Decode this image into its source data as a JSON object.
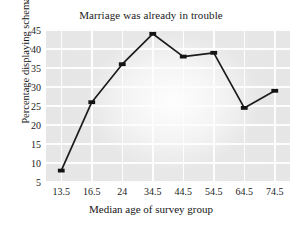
{
  "chart_data": {
    "type": "line",
    "title": "Marriage was already in trouble",
    "xlabel": "Median age of survey group",
    "ylabel": "Percentage displaying schema",
    "categories": [
      "13.5",
      "16.5",
      "24",
      "34.5",
      "44.5",
      "54.5",
      "64.5",
      "74.5"
    ],
    "values": [
      8,
      26,
      36,
      44,
      38,
      39,
      24.5,
      29
    ],
    "series": [
      {
        "name": "Percentage displaying schema",
        "values": [
          8,
          26,
          36,
          44,
          38,
          39,
          24.5,
          29
        ]
      }
    ],
    "ylim": [
      5,
      45
    ],
    "yticks": [
      5,
      10,
      15,
      20,
      25,
      30,
      35,
      40,
      45
    ],
    "ytick_labels": [
      "5",
      "10",
      "15",
      "20",
      "25",
      "30",
      "35",
      "40",
      "45"
    ],
    "xtick_labels": [
      "13.5",
      "16.5",
      "24",
      "34.5",
      "44.5",
      "54.5",
      "64.5",
      "74.5"
    ],
    "grid": true,
    "legend": "none",
    "marker": "square",
    "line_color": "#1c1c1c",
    "marker_color": "#141414",
    "plot_background": "#e7e7e7",
    "gridline_color": "#fdfdfd"
  }
}
